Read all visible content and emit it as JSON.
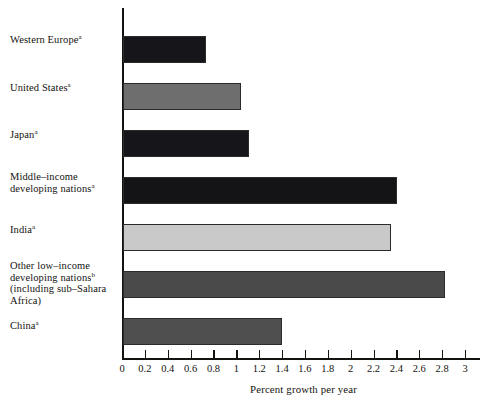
{
  "chart_data": {
    "type": "bar",
    "orientation": "horizontal",
    "title": "",
    "xlabel": "Percent growth per year",
    "ylabel": "",
    "xlim": [
      0,
      3
    ],
    "xticks": [
      "0",
      "0.2",
      "0.4",
      "0.6",
      "0.8",
      "1",
      "1.2",
      "1.4",
      "1.6",
      "1.8",
      "2",
      "2.2",
      "2.4",
      "2.6",
      "2.8",
      "3"
    ],
    "xtick_values": [
      0,
      0.2,
      0.4,
      0.6,
      0.8,
      1,
      1.2,
      1.4,
      1.6,
      1.8,
      2,
      2.2,
      2.4,
      2.6,
      2.8,
      3
    ],
    "grid": false,
    "legend": "none",
    "categories": [
      "Western Europe",
      "United States",
      "Japan",
      "Middle–income developing nations",
      "India",
      "Other low–income developing nations (including sub–Sahara Africa)",
      "China"
    ],
    "values": [
      0.73,
      1.03,
      1.1,
      2.4,
      2.34,
      2.82,
      1.39
    ],
    "bar_colors": [
      "#16161a",
      "#6e6e6e",
      "#16161a",
      "#141417",
      "#c9c9c9",
      "#4a4a4a",
      "#4f4f4f"
    ],
    "footnote_markers": [
      "a",
      "a",
      "a",
      "a",
      "a",
      "b",
      "a"
    ],
    "series": [
      {
        "name": "Percent growth per year",
        "values": [
          0.73,
          1.03,
          1.1,
          2.4,
          2.34,
          2.82,
          1.39
        ]
      }
    ]
  },
  "labels": {
    "western_europe": {
      "lines": [
        "Western Europe"
      ],
      "sup": "a"
    },
    "united_states": {
      "lines": [
        "United States"
      ],
      "sup": "a"
    },
    "japan": {
      "lines": [
        "Japan"
      ],
      "sup": "a"
    },
    "middle_income": {
      "line1": "Middle–income",
      "line2": "developing nations",
      "sup": "a"
    },
    "india": {
      "lines": [
        "India"
      ],
      "sup": "a"
    },
    "other_low_income": {
      "line1": "Other low–income",
      "line2": "developing nations",
      "sup": "b",
      "line3": "(including sub–Sahara",
      "line4": "Africa)"
    },
    "china": {
      "lines": [
        "China"
      ],
      "sup": "a"
    }
  },
  "axis": {
    "title": "Percent growth per year",
    "tick_0": "0",
    "tick_1": "0.2",
    "tick_2": "0.4",
    "tick_3": "0.6",
    "tick_4": "0.8",
    "tick_5": "1",
    "tick_6": "1.2",
    "tick_7": "1.4",
    "tick_8": "1.6",
    "tick_9": "1.8",
    "tick_10": "2",
    "tick_11": "2.2",
    "tick_12": "2.4",
    "tick_13": "2.6",
    "tick_14": "2.8",
    "tick_15": "3"
  },
  "colors": {
    "axis": "#14130f",
    "text": "#14130f",
    "background": "#ffffff"
  }
}
